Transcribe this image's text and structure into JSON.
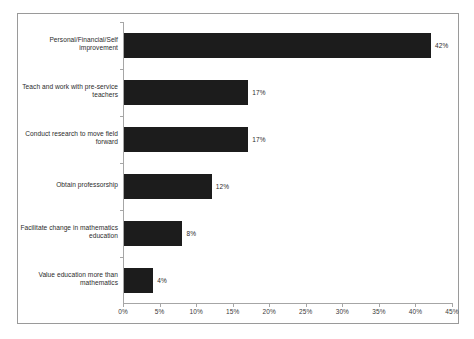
{
  "chart_data": {
    "type": "bar",
    "orientation": "horizontal",
    "title": "",
    "subtitle": "",
    "xlabel": "",
    "ylabel": "",
    "categories": [
      "Personal/Financial/Self improvement",
      "Teach and work with pre-service teachers",
      "Conduct research to move field forward",
      "Obtain professorship",
      "Facilitate change in mathematics education",
      "Value education more than mathematics"
    ],
    "values": [
      42,
      17,
      17,
      12,
      8,
      4
    ],
    "value_labels": [
      "42%",
      "17%",
      "17%",
      "12%",
      "8%",
      "4%"
    ],
    "xlim": [
      0,
      45
    ],
    "xticks": [
      0,
      5,
      10,
      15,
      20,
      25,
      30,
      35,
      40,
      45
    ],
    "xtick_labels": [
      "0%",
      "5%",
      "10%",
      "15%",
      "20%",
      "25%",
      "30%",
      "35%",
      "40%",
      "45%"
    ],
    "grid": false,
    "legend": null,
    "legend_position": "none",
    "colors": {
      "bar": "#1c1c1c",
      "axis": "#a6a6a6",
      "text": "#2b2b2b",
      "border": "#9a9a9a",
      "background": "#ffffff"
    }
  },
  "category_lines": [
    [
      "Personal/Financial/Self",
      "improvement"
    ],
    [
      "Teach and work with pre-service",
      "teachers"
    ],
    [
      "Conduct research to move field",
      "forward"
    ],
    [
      "Obtain professorship"
    ],
    [
      "Facilitate change in mathematics",
      "education"
    ],
    [
      "Value education more than",
      "mathematics"
    ]
  ]
}
